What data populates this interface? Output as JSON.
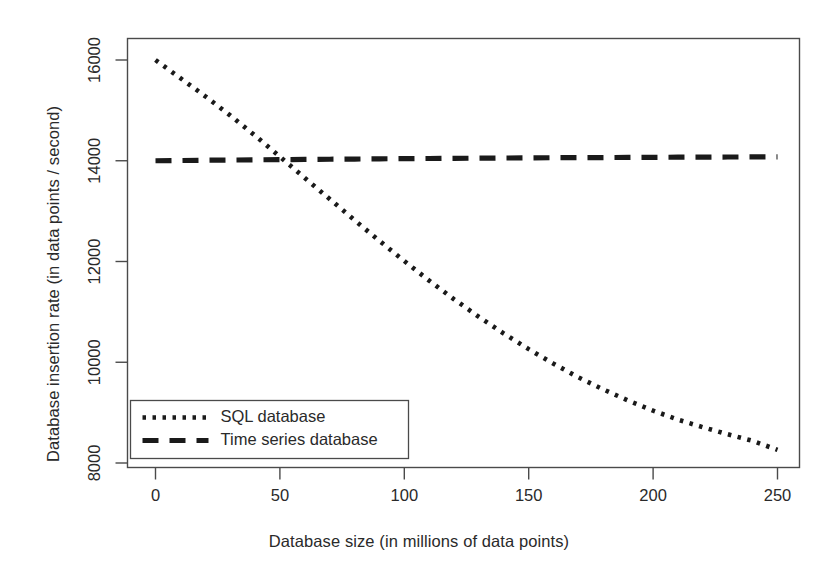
{
  "chart_data": {
    "type": "line",
    "title": "",
    "xlabel": "Database size (in millions of data points)",
    "ylabel": "Database insertion rate (in data points / second)",
    "xlim": [
      -8,
      258
    ],
    "ylim": [
      7700,
      16450
    ],
    "xticks": [
      0,
      50,
      100,
      150,
      200,
      250
    ],
    "xtick_labels": [
      "0",
      "50",
      "100",
      "150",
      "200",
      "250"
    ],
    "yticks": [
      8000,
      10000,
      12000,
      14000,
      16000
    ],
    "ytick_labels": [
      "8000",
      "10000",
      "12000",
      "14000",
      "16000"
    ],
    "grid": false,
    "legend_position": "bottom-left",
    "x": [
      0,
      10,
      20,
      30,
      40,
      50,
      60,
      70,
      80,
      90,
      100,
      110,
      120,
      130,
      140,
      150,
      160,
      170,
      180,
      190,
      200,
      210,
      220,
      230,
      240,
      250
    ],
    "series": [
      {
        "name": "SQL database",
        "linestyle": "dotted",
        "color": "#1a1a1a",
        "values": [
          16000,
          15640,
          15280,
          14900,
          14500,
          14080,
          13660,
          13240,
          12820,
          12410,
          12010,
          11620,
          11250,
          10900,
          10570,
          10260,
          9970,
          9700,
          9460,
          9240,
          9040,
          8860,
          8710,
          8570,
          8440,
          8260
        ]
      },
      {
        "name": "Time series database",
        "linestyle": "dashed",
        "color": "#1a1a1a",
        "values": [
          14000,
          14005,
          14010,
          14014,
          14018,
          14022,
          14026,
          14030,
          14034,
          14038,
          14042,
          14045,
          14048,
          14051,
          14054,
          14057,
          14060,
          14062,
          14064,
          14066,
          14068,
          14070,
          14072,
          14074,
          14076,
          14078
        ]
      }
    ],
    "annotations": []
  },
  "legend": {
    "entries": [
      {
        "label": "SQL database",
        "style": "dotted"
      },
      {
        "label": "Time series database",
        "style": "dashed"
      }
    ]
  },
  "colors": {
    "line": "#1a1a1a",
    "axis": "#4a4a4a",
    "background": "#ffffff",
    "text": "#2a2a2a"
  }
}
